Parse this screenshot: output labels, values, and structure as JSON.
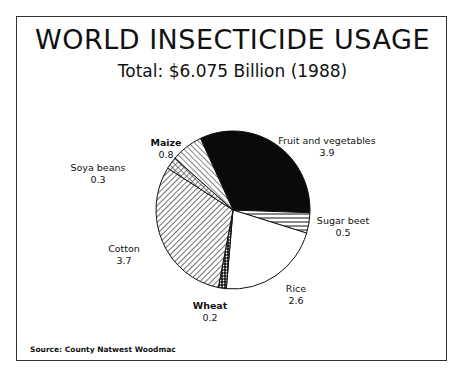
{
  "title": "WORLD INSECTICIDE USAGE",
  "subtitle": "Total: $6.075 Billion (1988)",
  "source": "Source: County Natwest Woodmac",
  "chart_data": {
    "type": "pie",
    "title": "WORLD INSECTICIDE USAGE",
    "subtitle": "Total: $6.075 Billion (1988)",
    "categories": [
      "Fruit and vegetables",
      "Sugar beet",
      "Rice",
      "Wheat",
      "Cotton",
      "Soya beans",
      "Maize"
    ],
    "values": [
      3.9,
      0.5,
      2.6,
      0.2,
      3.7,
      0.3,
      0.8
    ],
    "slice_fill": [
      "solid-black",
      "horizontal-lines",
      "white",
      "dots",
      "diagonal-lines",
      "crosshatch",
      "diagonal-lines-reverse"
    ],
    "legend": "none (direct labels)",
    "source": "Source: County Natwest Woodmac"
  },
  "labels": {
    "fruit": {
      "name": "Fruit and vegetables",
      "value": "3.9"
    },
    "sugar": {
      "name": "Sugar beet",
      "value": "0.5"
    },
    "rice": {
      "name": "Rice",
      "value": "2.6"
    },
    "wheat": {
      "name": "Wheat",
      "value": "0.2"
    },
    "cotton": {
      "name": "Cotton",
      "value": "3.7"
    },
    "soya": {
      "name": "Soya beans",
      "value": "0.3"
    },
    "maize": {
      "name": "Maize",
      "value": "0.8"
    }
  }
}
